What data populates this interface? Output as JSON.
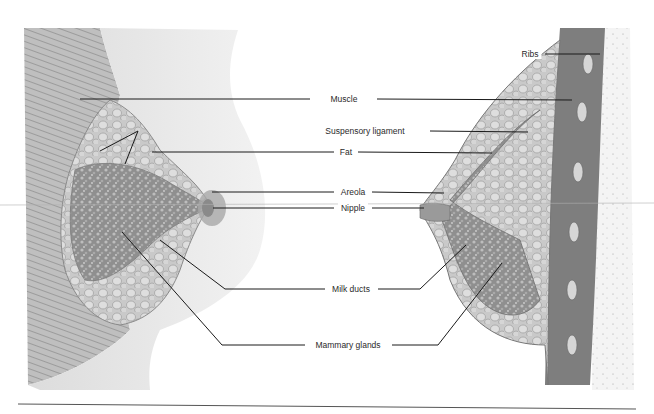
{
  "diagram": {
    "labels": {
      "muscle": "Muscle",
      "suspensory_ligament": "Suspensory ligament",
      "fat": "Fat",
      "areola": "Areola",
      "nipple": "Nipple",
      "milk_ducts": "Milk ducts",
      "mammary_glands": "Mammary glands",
      "ribs": "Ribs"
    },
    "colors": {
      "line": "#1a1a1a",
      "tissue_dark": "#6e6e6e",
      "tissue_mid": "#9a9a9a",
      "tissue_light": "#cfcfcf",
      "skin": "#e6e6e6"
    }
  }
}
